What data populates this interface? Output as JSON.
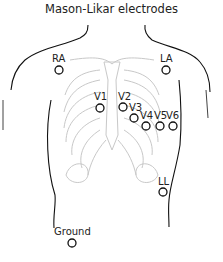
{
  "title": "Mason-Likar electrodes",
  "electrodes": [
    {
      "id": "RA",
      "label": "RA",
      "x": 59,
      "y": 70,
      "lx": 52,
      "ly": 54
    },
    {
      "id": "LA",
      "label": "LA",
      "x": 166,
      "y": 70,
      "lx": 160,
      "ly": 54
    },
    {
      "id": "V1",
      "label": "V1",
      "x": 100,
      "y": 108,
      "lx": 95,
      "ly": 92
    },
    {
      "id": "V2",
      "label": "V2",
      "x": 123,
      "y": 107,
      "lx": 118,
      "ly": 92
    },
    {
      "id": "V3",
      "label": "V3",
      "x": 134,
      "y": 118,
      "lx": 129,
      "ly": 103
    },
    {
      "id": "V4",
      "label": "V4",
      "x": 146,
      "y": 126,
      "lx": 141,
      "ly": 111
    },
    {
      "id": "V5",
      "label": "V5",
      "x": 160,
      "y": 126,
      "lx": 154,
      "ly": 111
    },
    {
      "id": "V6",
      "label": "V6",
      "x": 172,
      "y": 126,
      "lx": 166,
      "ly": 111
    },
    {
      "id": "LL",
      "label": "LL",
      "x": 163,
      "y": 192,
      "lx": 158,
      "ly": 177
    },
    {
      "id": "Ground",
      "label": "Ground",
      "x": 72,
      "y": 243,
      "lx": 54,
      "ly": 227
    }
  ]
}
